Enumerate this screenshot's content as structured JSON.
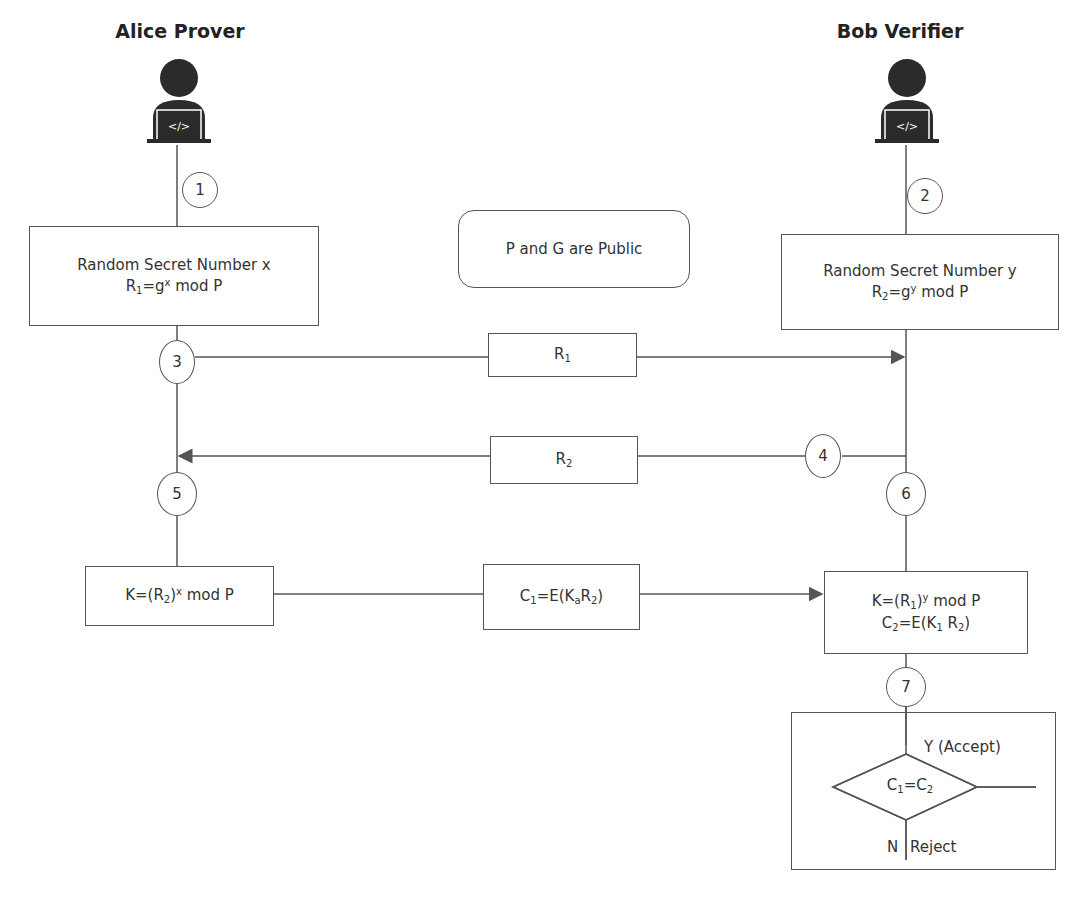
{
  "actors": {
    "prover": {
      "title": "Alice Prover",
      "icon": "developer-laptop-icon"
    },
    "verifier": {
      "title": "Bob Verifier",
      "icon": "developer-laptop-icon"
    }
  },
  "steps": [
    "1",
    "2",
    "3",
    "4",
    "5",
    "6",
    "7"
  ],
  "public_note": "P and G are Public",
  "prover_box": {
    "line1": "Random Secret Number x",
    "r_base": "R",
    "r_sub": "1",
    "eq": "=g",
    "exp": "x",
    "rest": " mod P"
  },
  "verifier_box": {
    "line1": "Random Secret Number y",
    "r_base": "R",
    "r_sub": "2",
    "eq": "=g",
    "exp": "y",
    "rest": " mod P"
  },
  "messages": {
    "r1": {
      "base": "R",
      "sub": "1"
    },
    "r2": {
      "base": "R",
      "sub": "2"
    },
    "c1": {
      "c": "C",
      "c_sub": "1",
      "eq": "=E(K",
      "k_sub": "a",
      "r": "R",
      "r_sub": "2",
      "close": ")"
    }
  },
  "prover_key": {
    "pre": "K=(R",
    "sub": "2",
    "close": ")",
    "exp": "x",
    "rest": " mod P"
  },
  "verifier_key": {
    "k_pre": "K=(R",
    "k_sub": "1",
    "k_close": ")",
    "k_exp": "y",
    "k_rest": " mod P",
    "c_pre": "C",
    "c_sub": "2",
    "c_mid": "=E(K",
    "c_ksub": "1",
    "c_r": " R",
    "c_rsub": "2",
    "c_close": ")"
  },
  "decision": {
    "c1": "C",
    "c1_sub": "1",
    "eq": "=C",
    "c2_sub": "2",
    "yes_label": "Y (Accept)",
    "no_label": "N",
    "reject_label": "Reject"
  },
  "colors": {
    "line": "#555555",
    "text": "#333333",
    "icon": "#2b2b2b"
  }
}
